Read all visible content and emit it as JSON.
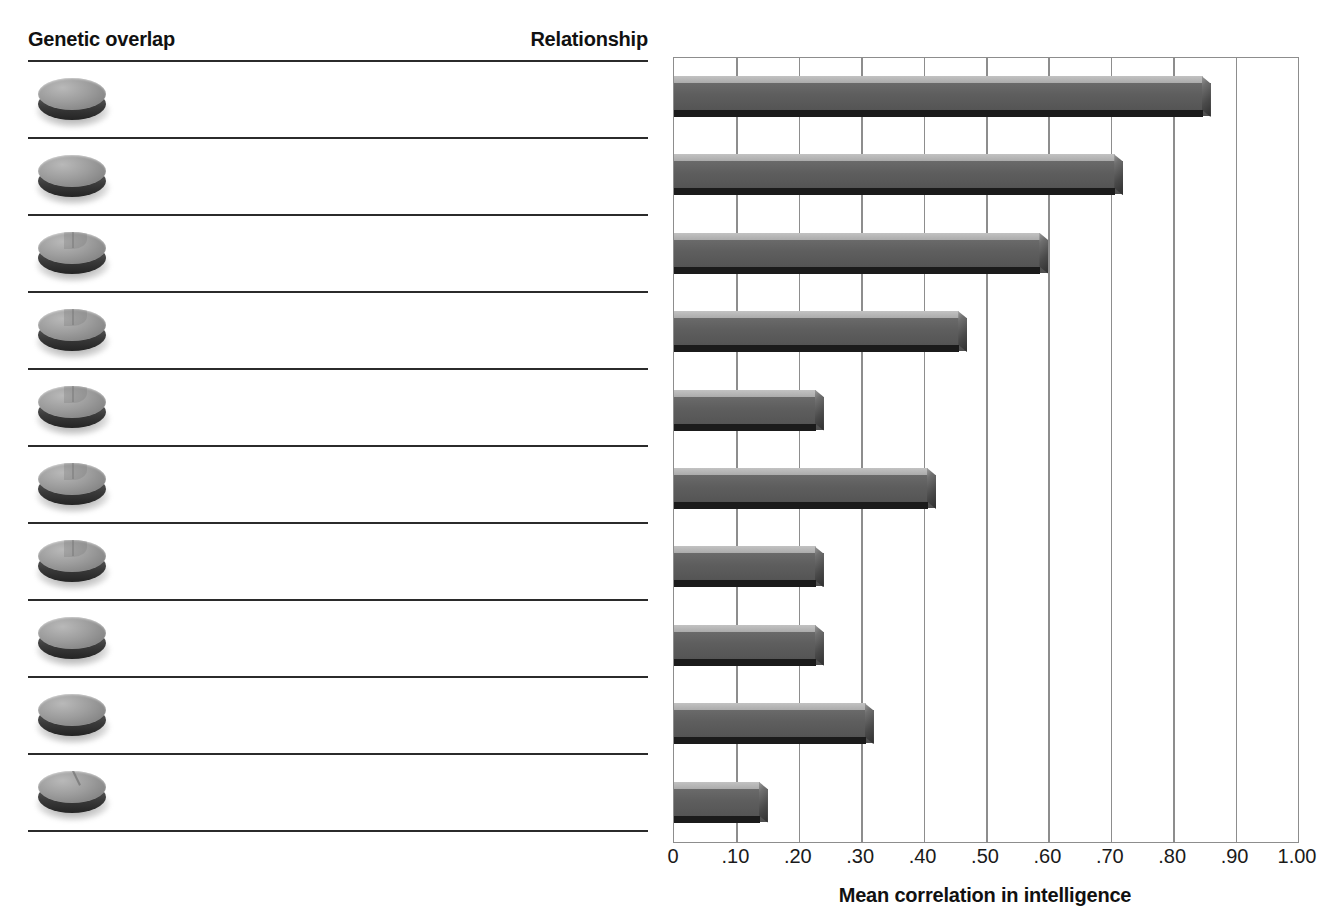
{
  "table": {
    "headers": {
      "genetic_overlap": "Genetic overlap",
      "relationship": "Relationship"
    },
    "rows": [
      {
        "overlap": "100%",
        "relationship": "Identical twins reared together"
      },
      {
        "overlap": "100%",
        "relationship": "Identical twins reared apart"
      },
      {
        "overlap": "50%",
        "relationship": "Fraternal twins reared together"
      },
      {
        "overlap": "50%",
        "relationship": "Siblings reared together"
      },
      {
        "overlap": "50%",
        "relationship": "Siblings reared apart"
      },
      {
        "overlap": "50%",
        "relationship": "Biological parent and child, lived together"
      },
      {
        "overlap": "50%",
        "relationship": "Biological parent and child, lived apart"
      },
      {
        "overlap": "0%",
        "relationship": "Adoptive parent and child, lived together"
      },
      {
        "overlap": "0%",
        "relationship": "Adoptive siblings reared together"
      },
      {
        "overlap": "12.5%",
        "relationship": "Cousins reared apart"
      }
    ]
  },
  "chart_data": {
    "type": "bar",
    "orientation": "horizontal",
    "title": "",
    "xlabel": "Mean correlation in intelligence",
    "ylabel": "",
    "xlim": [
      0,
      1.0
    ],
    "grid": true,
    "legend": false,
    "tick_labels": [
      "0",
      ".10",
      ".20",
      ".30",
      ".40",
      ".50",
      ".60",
      ".70",
      ".80",
      ".90",
      "1.00"
    ],
    "tick_values": [
      0,
      0.1,
      0.2,
      0.3,
      0.4,
      0.5,
      0.6,
      0.7,
      0.8,
      0.9,
      1.0
    ],
    "categories": [
      "Identical twins reared together",
      "Identical twins reared apart",
      "Fraternal twins reared together",
      "Siblings reared together",
      "Siblings reared apart",
      "Biological parent and child, lived together",
      "Biological parent and child, lived apart",
      "Adoptive parent and child, lived together",
      "Adoptive siblings reared together",
      "Cousins reared apart"
    ],
    "values": [
      0.86,
      0.72,
      0.6,
      0.47,
      0.24,
      0.42,
      0.24,
      0.24,
      0.32,
      0.15
    ]
  },
  "colors": {
    "bar_face": "#5c5c5c",
    "bar_top": "#b4b4b4",
    "bar_base": "#1b1b1b",
    "gridline": "#8d8d8d",
    "rule": "#2b2b2b",
    "text": "#1a1a1a",
    "background": "#ffffff"
  },
  "icons": {
    "overlap_disc": "disc-icon"
  }
}
